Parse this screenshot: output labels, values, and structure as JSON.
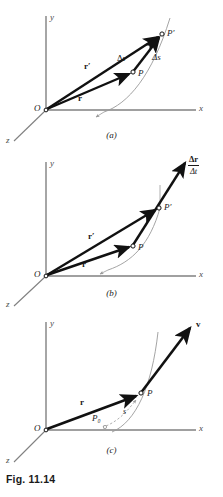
{
  "figure": {
    "caption": "Fig. 11.14",
    "colors": {
      "axis": "#808080",
      "vector": "#111111",
      "trajectory": "#9a9a9a",
      "background": "#ffffff",
      "text": "#1a1a1a"
    }
  },
  "panels": [
    {
      "tag": "(a)",
      "axes": {
        "x": "x",
        "y": "y",
        "z": "z"
      },
      "origin": "O",
      "points": [
        {
          "name": "P",
          "label": "P"
        },
        {
          "name": "P-prime",
          "label": "P′"
        }
      ],
      "vectors": [
        {
          "name": "r",
          "label": "r"
        },
        {
          "name": "r-prime",
          "label": "r′"
        },
        {
          "name": "delta-r",
          "label": "Δr"
        }
      ],
      "scalars": [
        {
          "name": "delta-s",
          "label": "Δs"
        }
      ]
    },
    {
      "tag": "(b)",
      "axes": {
        "x": "x",
        "y": "y",
        "z": "z"
      },
      "origin": "O",
      "points": [
        {
          "name": "P",
          "label": "P"
        },
        {
          "name": "P-prime",
          "label": "P′"
        }
      ],
      "vectors": [
        {
          "name": "r",
          "label": "r"
        },
        {
          "name": "r-prime",
          "label": "r′"
        }
      ],
      "fraction": {
        "numerator": "Δr",
        "denominator": "Δt"
      }
    },
    {
      "tag": "(c)",
      "axes": {
        "x": "x",
        "y": "y",
        "z": "z"
      },
      "origin": "O",
      "points": [
        {
          "name": "P",
          "label": "P"
        },
        {
          "name": "P-zero",
          "label": "P₀"
        }
      ],
      "vectors": [
        {
          "name": "r",
          "label": "r"
        },
        {
          "name": "v",
          "label": "v"
        }
      ],
      "scalars": [
        {
          "name": "arc-length-s",
          "label": "s"
        }
      ]
    }
  ]
}
